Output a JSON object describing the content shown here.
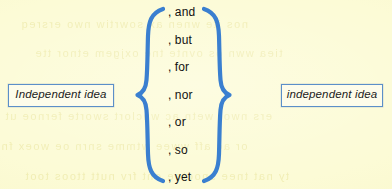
{
  "figure": {
    "background_color": "#fcfbd4",
    "brace_color": "#3a7fd0",
    "box_border_color": "#5b8fc9",
    "box_fill_color": "#fdfcea",
    "text_color": "#111111"
  },
  "left_clause": {
    "label": "Independent idea"
  },
  "right_clause": {
    "label": "independent idea"
  },
  "braces": {
    "left_icon": "left-curly-brace",
    "right_icon": "right-curly-brace"
  },
  "conjunctions": [
    {
      "label": ", and"
    },
    {
      "label": ", but"
    },
    {
      "label": ", for"
    },
    {
      "label": ", nor"
    },
    {
      "label": ", or"
    },
    {
      "label": ", so"
    },
    {
      "label": ", yet"
    }
  ],
  "background_ghost_lines": [
    {
      "text": "nos ite wnen ax sowrtiw nwo ersreq"
    },
    {
      "text": "tiea wwn os ovnte tne oxjgem etnor tte"
    },
    {
      "text": "ers nwot wetn ac wnclort sworte fernoe ut"
    },
    {
      "text": "or ac aff wwee wtmme snrn oe woex fn"
    },
    {
      "text": "ty nat tnee  snoctoe ont frv nutt ttoos toot"
    }
  ]
}
